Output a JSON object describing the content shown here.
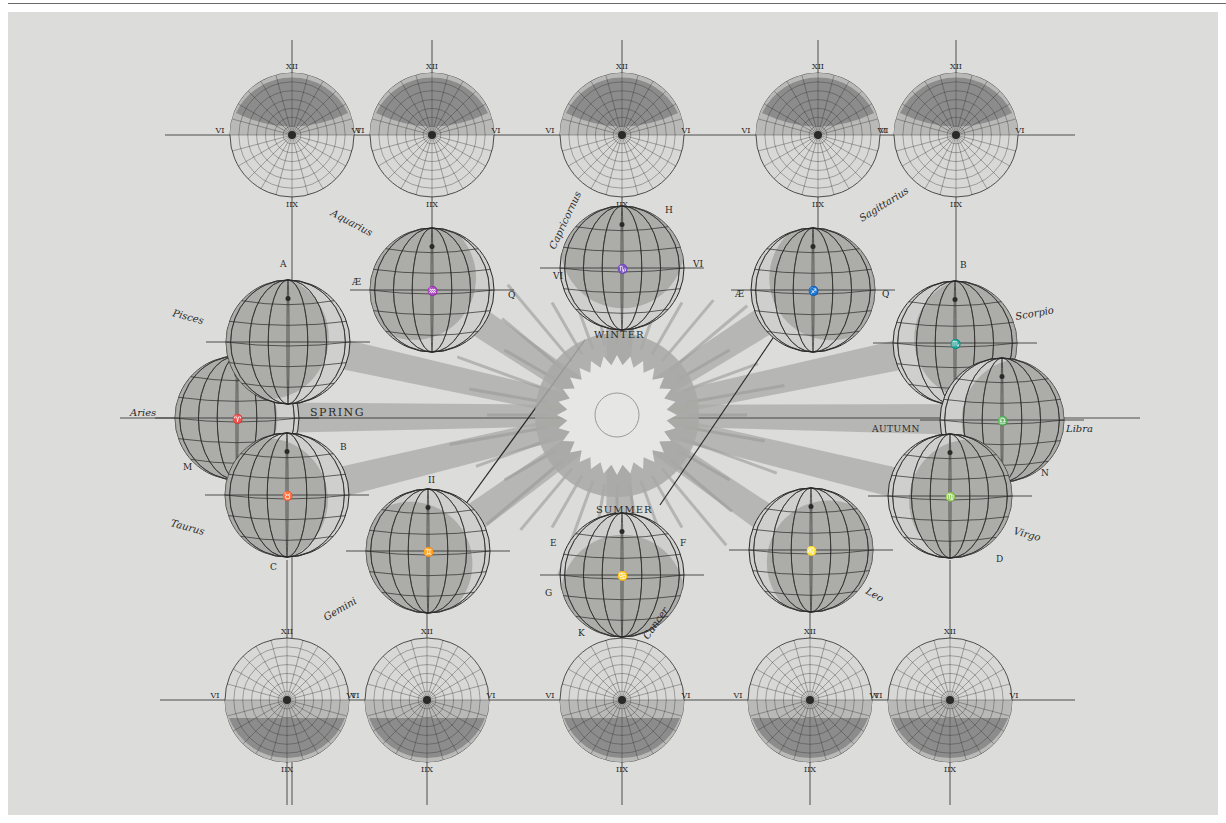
{
  "plate": {
    "title": "",
    "background": "#dcdcda",
    "ink": "#2a2a2a",
    "shade_dark": "#8c8c8c",
    "shade_light": "#b9b9b7"
  },
  "sun": {
    "cx": 617,
    "cy": 415,
    "season_labels": {
      "winter": "WINTER",
      "summer": "SUMMER",
      "spring": "SPRING",
      "autumn": "AUTUMN"
    }
  },
  "earths": [
    {
      "id": "aries",
      "sign": "Aries",
      "cx": 237,
      "cy": 418,
      "r": 62,
      "symbol": "♈",
      "labels": [
        {
          "t": "M",
          "x": 183,
          "y": 470
        }
      ]
    },
    {
      "id": "pisces",
      "sign": "Pisces",
      "cx": 288,
      "cy": 342,
      "r": 62,
      "labels": [
        {
          "t": "A",
          "x": 280,
          "y": 267
        }
      ]
    },
    {
      "id": "aquarius",
      "sign": "Aquarius",
      "cx": 432,
      "cy": 290,
      "r": 62,
      "symbol": "♒",
      "labels": [
        {
          "t": "Æ",
          "x": 352,
          "y": 285
        },
        {
          "t": "Q",
          "x": 508,
          "y": 298
        }
      ]
    },
    {
      "id": "capricornus",
      "sign": "Capricornus",
      "cx": 622,
      "cy": 268,
      "r": 62,
      "symbol": "♑",
      "labels": [
        {
          "t": "H",
          "x": 665,
          "y": 213
        },
        {
          "t": "VI",
          "x": 693,
          "y": 267
        },
        {
          "t": "VI",
          "x": 553,
          "y": 279
        }
      ]
    },
    {
      "id": "sagittarius",
      "sign": "Sagittarius",
      "cx": 813,
      "cy": 290,
      "r": 62,
      "symbol": "♐",
      "labels": [
        {
          "t": "Æ",
          "x": 735,
          "y": 297
        },
        {
          "t": "Q",
          "x": 882,
          "y": 297
        }
      ]
    },
    {
      "id": "scorpio",
      "sign": "Scorpio",
      "cx": 955,
      "cy": 343,
      "r": 62,
      "symbol": "♏",
      "labels": [
        {
          "t": "B",
          "x": 960,
          "y": 268
        }
      ]
    },
    {
      "id": "libra",
      "sign": "Libra",
      "cx": 1002,
      "cy": 420,
      "r": 62,
      "symbol": "♎",
      "labels": [
        {
          "t": "N",
          "x": 1041,
          "y": 476
        }
      ]
    },
    {
      "id": "virgo",
      "sign": "Virgo",
      "cx": 950,
      "cy": 496,
      "r": 62,
      "symbol": "♍",
      "labels": [
        {
          "t": "D",
          "x": 996,
          "y": 562
        }
      ]
    },
    {
      "id": "leo",
      "sign": "Leo",
      "cx": 811,
      "cy": 550,
      "r": 62,
      "symbol": "♌"
    },
    {
      "id": "cancer",
      "sign": "Cancer",
      "cx": 622,
      "cy": 575,
      "r": 62,
      "symbol": "♋",
      "labels": [
        {
          "t": "E",
          "x": 550,
          "y": 546
        },
        {
          "t": "F",
          "x": 680,
          "y": 546
        },
        {
          "t": "G",
          "x": 545,
          "y": 596
        },
        {
          "t": "K",
          "x": 578,
          "y": 636
        }
      ]
    },
    {
      "id": "gemini",
      "sign": "Gemini",
      "cx": 428,
      "cy": 551,
      "r": 62,
      "symbol": "♊",
      "labels": [
        {
          "t": "II",
          "x": 428,
          "y": 483
        }
      ]
    },
    {
      "id": "taurus",
      "sign": "Taurus",
      "cx": 287,
      "cy": 495,
      "r": 62,
      "symbol": "♉",
      "labels": [
        {
          "t": "C",
          "x": 270,
          "y": 570
        },
        {
          "t": "B",
          "x": 340,
          "y": 450
        }
      ]
    }
  ],
  "sign_labels": [
    {
      "text": "Aries",
      "x": 130,
      "y": 416,
      "rot": 0
    },
    {
      "text": "Pisces",
      "x": 172,
      "y": 316,
      "rot": 15
    },
    {
      "text": "Aquarius",
      "x": 330,
      "y": 215,
      "rot": 28
    },
    {
      "text": "Capricornus",
      "x": 555,
      "y": 250,
      "rot": -65
    },
    {
      "text": "Sagittarius",
      "x": 862,
      "y": 222,
      "rot": -32
    },
    {
      "text": "Scorpio",
      "x": 1016,
      "y": 320,
      "rot": -10
    },
    {
      "text": "Libra",
      "x": 1066,
      "y": 432,
      "rot": 0
    },
    {
      "text": "Virgo",
      "x": 1013,
      "y": 534,
      "rot": 15
    },
    {
      "text": "Leo",
      "x": 865,
      "y": 593,
      "rot": 30
    },
    {
      "text": "Cancer",
      "x": 648,
      "y": 640,
      "rot": -55
    },
    {
      "text": "Gemini",
      "x": 326,
      "y": 621,
      "rot": -30
    },
    {
      "text": "Taurus",
      "x": 170,
      "y": 526,
      "rot": 15
    }
  ],
  "dials_top": [
    {
      "cx": 292,
      "cy": 135,
      "r": 62,
      "shade": "upper",
      "numerals": {
        "top": "XII",
        "left": "VI",
        "right": "VI",
        "bottom": "IIX"
      }
    },
    {
      "cx": 432,
      "cy": 135,
      "r": 62,
      "shade": "upper",
      "numerals": {
        "top": "XII",
        "left": "VI",
        "right": "VI",
        "bottom": "IIX"
      }
    },
    {
      "cx": 622,
      "cy": 135,
      "r": 62,
      "shade": "upper",
      "numerals": {
        "top": "XII",
        "left": "VI",
        "right": "VI",
        "bottom": "IIX"
      }
    },
    {
      "cx": 818,
      "cy": 135,
      "r": 62,
      "shade": "upper",
      "numerals": {
        "top": "XII",
        "left": "VI",
        "right": "VI",
        "bottom": "IIX"
      }
    },
    {
      "cx": 956,
      "cy": 135,
      "r": 62,
      "shade": "upper",
      "numerals": {
        "top": "XII",
        "left": "VI",
        "right": "VI",
        "bottom": "IIX"
      }
    }
  ],
  "dials_bottom": [
    {
      "cx": 287,
      "cy": 700,
      "r": 62,
      "shade": "lower",
      "numerals": {
        "top": "XII",
        "left": "VI",
        "right": "VI",
        "bottom": "IIX"
      }
    },
    {
      "cx": 427,
      "cy": 700,
      "r": 62,
      "shade": "lower",
      "numerals": {
        "top": "XII",
        "left": "VI",
        "right": "VI",
        "bottom": "IIX"
      }
    },
    {
      "cx": 622,
      "cy": 700,
      "r": 62,
      "shade": "lower",
      "numerals": {
        "top": "XII",
        "left": "VI",
        "right": "VI",
        "bottom": "IIX"
      }
    },
    {
      "cx": 810,
      "cy": 700,
      "r": 62,
      "shade": "lower",
      "numerals": {
        "top": "XII",
        "left": "VI",
        "right": "VI",
        "bottom": "IIX"
      }
    },
    {
      "cx": 950,
      "cy": 700,
      "r": 62,
      "shade": "lower",
      "numerals": {
        "top": "XII",
        "left": "VI",
        "right": "VI",
        "bottom": "IIX"
      }
    }
  ],
  "dial_hour_ring_top": [
    "XII",
    "I",
    "II",
    "III",
    "IIII",
    "V",
    "VI",
    "VII",
    "VIII",
    "IX",
    "X",
    "XI"
  ],
  "dial_hour_ring_bottom": [
    "VI",
    "V",
    "IIII",
    "III",
    "II",
    "I",
    "IIX",
    "IX",
    "X",
    "XI",
    "XII"
  ]
}
